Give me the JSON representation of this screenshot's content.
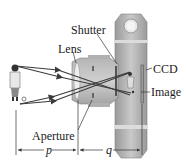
{
  "diagram": {
    "type": "camera-optics",
    "labels": {
      "shutter": "Shutter",
      "lens": "Lens",
      "ccd": "CCD",
      "image": "Image",
      "aperture": "Aperture",
      "object_distance": "p",
      "image_distance": "q"
    },
    "colors": {
      "body_light": "#c8c8c8",
      "body_mid": "#a9a9a9",
      "body_dark": "#8c8c8c",
      "ray": "#3a3a3a",
      "text": "#1a1a1a"
    }
  }
}
